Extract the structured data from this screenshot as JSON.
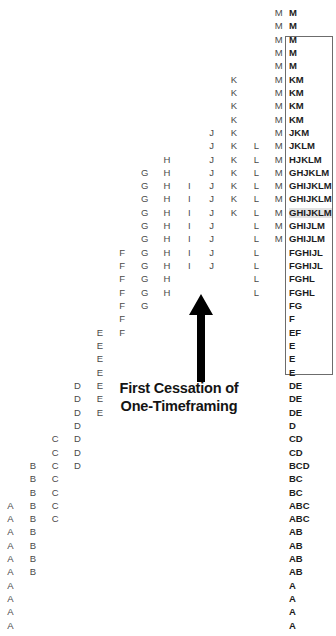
{
  "chart_data": {
    "type": "table",
    "xlabel": "",
    "ylabel": "",
    "grid": false,
    "legend": "none",
    "columns": [
      "A",
      "B",
      "C",
      "D",
      "E",
      "F",
      "G",
      "H",
      "I",
      "J",
      "K",
      "L",
      "M"
    ],
    "row_count": 46,
    "rows": [
      {
        "index": 0,
        "letters": [
          "M"
        ],
        "profile": "M"
      },
      {
        "index": 1,
        "letters": [
          "M"
        ],
        "profile": "M"
      },
      {
        "index": 2,
        "letters": [
          "M"
        ],
        "profile": "M"
      },
      {
        "index": 3,
        "letters": [
          "M"
        ],
        "profile": "M"
      },
      {
        "index": 4,
        "letters": [
          "M"
        ],
        "profile": "M"
      },
      {
        "index": 5,
        "letters": [
          "K",
          "M"
        ],
        "profile": "KM"
      },
      {
        "index": 6,
        "letters": [
          "K",
          "M"
        ],
        "profile": "KM"
      },
      {
        "index": 7,
        "letters": [
          "K",
          "M"
        ],
        "profile": "KM"
      },
      {
        "index": 8,
        "letters": [
          "K",
          "M"
        ],
        "profile": "KM"
      },
      {
        "index": 9,
        "letters": [
          "J",
          "K",
          "M"
        ],
        "profile": "JKM"
      },
      {
        "index": 10,
        "letters": [
          "J",
          "K",
          "L",
          "M"
        ],
        "profile": "JKLM"
      },
      {
        "index": 11,
        "letters": [
          "H",
          "J",
          "K",
          "L",
          "M"
        ],
        "profile": "HJKLM"
      },
      {
        "index": 12,
        "letters": [
          "G",
          "H",
          "J",
          "K",
          "L",
          "M"
        ],
        "profile": "GHJKLM"
      },
      {
        "index": 13,
        "letters": [
          "G",
          "H",
          "I",
          "J",
          "K",
          "L",
          "M"
        ],
        "profile": "GHIJKLM"
      },
      {
        "index": 14,
        "letters": [
          "G",
          "H",
          "I",
          "J",
          "K",
          "L",
          "M"
        ],
        "profile": "GHIJKLM"
      },
      {
        "index": 15,
        "letters": [
          "G",
          "H",
          "I",
          "J",
          "K",
          "L",
          "M"
        ],
        "profile": "GHIJKLM",
        "highlight": true
      },
      {
        "index": 16,
        "letters": [
          "G",
          "H",
          "I",
          "J",
          "L",
          "M"
        ],
        "profile": "GHIJLM"
      },
      {
        "index": 17,
        "letters": [
          "G",
          "H",
          "I",
          "J",
          "L",
          "M"
        ],
        "profile": "GHIJLM"
      },
      {
        "index": 18,
        "letters": [
          "F",
          "G",
          "H",
          "I",
          "J",
          "L"
        ],
        "profile": "FGHIJL"
      },
      {
        "index": 19,
        "letters": [
          "F",
          "G",
          "H",
          "I",
          "J",
          "L"
        ],
        "profile": "FGHIJL"
      },
      {
        "index": 20,
        "letters": [
          "F",
          "G",
          "H",
          "L"
        ],
        "profile": "FGHL"
      },
      {
        "index": 21,
        "letters": [
          "F",
          "G",
          "H",
          "L"
        ],
        "profile": "FGHL"
      },
      {
        "index": 22,
        "letters": [
          "F",
          "G"
        ],
        "profile": "FG"
      },
      {
        "index": 23,
        "letters": [
          "F"
        ],
        "profile": "F"
      },
      {
        "index": 24,
        "letters": [
          "E",
          "F"
        ],
        "profile": "EF"
      },
      {
        "index": 25,
        "letters": [
          "E"
        ],
        "profile": "E"
      },
      {
        "index": 26,
        "letters": [
          "E"
        ],
        "profile": "E"
      },
      {
        "index": 27,
        "letters": [
          "E"
        ],
        "profile": "E"
      },
      {
        "index": 28,
        "letters": [
          "D",
          "E"
        ],
        "profile": "DE"
      },
      {
        "index": 29,
        "letters": [
          "D",
          "E"
        ],
        "profile": "DE"
      },
      {
        "index": 30,
        "letters": [
          "D",
          "E"
        ],
        "profile": "DE"
      },
      {
        "index": 31,
        "letters": [
          "D"
        ],
        "profile": "D"
      },
      {
        "index": 32,
        "letters": [
          "C",
          "D"
        ],
        "profile": "CD"
      },
      {
        "index": 33,
        "letters": [
          "C",
          "D"
        ],
        "profile": "CD"
      },
      {
        "index": 34,
        "letters": [
          "B",
          "C",
          "D"
        ],
        "profile": "BCD"
      },
      {
        "index": 35,
        "letters": [
          "B",
          "C"
        ],
        "profile": "BC"
      },
      {
        "index": 36,
        "letters": [
          "B",
          "C"
        ],
        "profile": "BC"
      },
      {
        "index": 37,
        "letters": [
          "A",
          "B",
          "C"
        ],
        "profile": "ABC"
      },
      {
        "index": 38,
        "letters": [
          "A",
          "B",
          "C"
        ],
        "profile": "ABC"
      },
      {
        "index": 39,
        "letters": [
          "A",
          "B"
        ],
        "profile": "AB"
      },
      {
        "index": 40,
        "letters": [
          "A",
          "B"
        ],
        "profile": "AB"
      },
      {
        "index": 41,
        "letters": [
          "A",
          "B"
        ],
        "profile": "AB"
      },
      {
        "index": 42,
        "letters": [
          "A",
          "B"
        ],
        "profile": "AB"
      },
      {
        "index": 43,
        "letters": [
          "A"
        ],
        "profile": "A"
      },
      {
        "index": 44,
        "letters": [
          "A"
        ],
        "profile": "A"
      },
      {
        "index": 45,
        "letters": [
          "A"
        ],
        "profile": "A"
      },
      {
        "index": 46,
        "letters": [
          "A"
        ],
        "profile": "A"
      }
    ]
  },
  "annotation": {
    "label_line1": "First Cessation of",
    "label_line2": "One-Timeframing",
    "arrow_direction": "up"
  },
  "colors": {
    "tpo_letter": "#4a4a4a",
    "profile_letter": "#1c1c1c",
    "box_border": "#6c6c6c",
    "highlight_row": "#e3e3e3",
    "arrow": "#000000",
    "background": "#ffffff"
  }
}
